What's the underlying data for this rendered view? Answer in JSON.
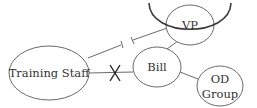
{
  "diagram": {
    "type": "relationship-map",
    "nodes": [
      {
        "id": "training_staff",
        "label": "Training Staff"
      },
      {
        "id": "bill",
        "label": "Bill"
      },
      {
        "id": "vp",
        "label": "VP"
      },
      {
        "id": "od_group",
        "label_line1": "OD",
        "label_line2": "Group"
      }
    ],
    "edges": [
      {
        "from": "training_staff",
        "to": "vp",
        "style": "broken"
      },
      {
        "from": "training_staff",
        "to": "bill",
        "style": "cut-x"
      },
      {
        "from": "bill",
        "to": "vp",
        "style": "solid"
      },
      {
        "from": "bill",
        "to": "od_group",
        "style": "solid"
      }
    ],
    "annotations": [
      {
        "type": "protective-arc",
        "around": "vp"
      }
    ],
    "colors": {
      "line": "#6a6a6a",
      "arc": "#3a3a3a",
      "text": "#333333"
    }
  }
}
